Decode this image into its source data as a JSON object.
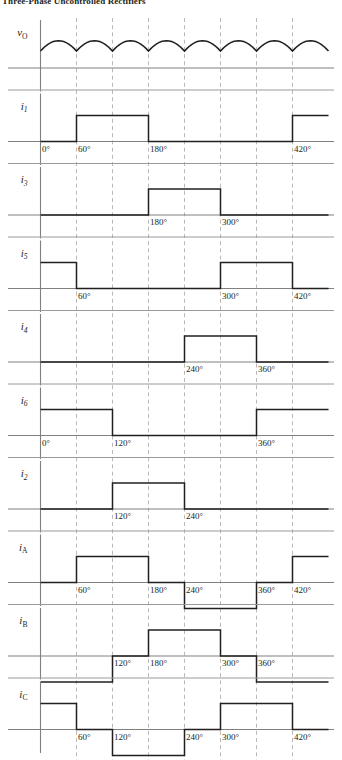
{
  "caption": {
    "text": "Three-Phase Uncontrolled Rectifiers"
  },
  "figure": {
    "x_axis": {
      "unit": "deg",
      "origin_deg": 0,
      "end_deg": 480,
      "grid_step_deg": 60,
      "gridlines_deg": [
        60,
        120,
        180,
        240,
        300,
        360,
        420
      ]
    },
    "panels": [
      {
        "name": "vo",
        "label": "v",
        "subscript": "O",
        "type": "rectified-sine",
        "description": "six-pulse rectified output voltage",
        "humps": 8,
        "hump_width_deg": 60,
        "deg_labels": []
      },
      {
        "name": "i1",
        "label": "i",
        "subscript": "1",
        "type": "pulse",
        "levels": [
          {
            "from_deg": 0,
            "to_deg": 60,
            "value": 0
          },
          {
            "from_deg": 60,
            "to_deg": 180,
            "value": 1
          },
          {
            "from_deg": 180,
            "to_deg": 420,
            "value": 0
          },
          {
            "from_deg": 420,
            "to_deg": 480,
            "value": 1
          }
        ],
        "deg_labels": [
          {
            "deg": 0,
            "text": "0°"
          },
          {
            "deg": 60,
            "text": "60°"
          },
          {
            "deg": 180,
            "text": "180°"
          },
          {
            "deg": 420,
            "text": "420°"
          }
        ]
      },
      {
        "name": "i3",
        "label": "i",
        "subscript": "3",
        "type": "pulse",
        "levels": [
          {
            "from_deg": 0,
            "to_deg": 180,
            "value": 0
          },
          {
            "from_deg": 180,
            "to_deg": 300,
            "value": 1
          },
          {
            "from_deg": 300,
            "to_deg": 480,
            "value": 0
          }
        ],
        "deg_labels": [
          {
            "deg": 180,
            "text": "180°"
          },
          {
            "deg": 300,
            "text": "300°"
          }
        ]
      },
      {
        "name": "i5",
        "label": "i",
        "subscript": "5",
        "type": "pulse",
        "levels": [
          {
            "from_deg": 0,
            "to_deg": 60,
            "value": 1
          },
          {
            "from_deg": 60,
            "to_deg": 300,
            "value": 0
          },
          {
            "from_deg": 300,
            "to_deg": 420,
            "value": 1
          },
          {
            "from_deg": 420,
            "to_deg": 480,
            "value": 0
          }
        ],
        "deg_labels": [
          {
            "deg": 60,
            "text": "60°"
          },
          {
            "deg": 300,
            "text": "300°"
          },
          {
            "deg": 420,
            "text": "420°"
          }
        ]
      },
      {
        "name": "i4",
        "label": "i",
        "subscript": "4",
        "type": "pulse",
        "levels": [
          {
            "from_deg": 0,
            "to_deg": 240,
            "value": 0
          },
          {
            "from_deg": 240,
            "to_deg": 360,
            "value": 1
          },
          {
            "from_deg": 360,
            "to_deg": 480,
            "value": 0
          }
        ],
        "deg_labels": [
          {
            "deg": 240,
            "text": "240°"
          },
          {
            "deg": 360,
            "text": "360°"
          }
        ]
      },
      {
        "name": "i6",
        "label": "i",
        "subscript": "6",
        "type": "pulse",
        "levels": [
          {
            "from_deg": 0,
            "to_deg": 120,
            "value": 1
          },
          {
            "from_deg": 120,
            "to_deg": 360,
            "value": 0
          },
          {
            "from_deg": 360,
            "to_deg": 480,
            "value": 1
          }
        ],
        "deg_labels": [
          {
            "deg": 0,
            "text": "0°"
          },
          {
            "deg": 120,
            "text": "120°"
          },
          {
            "deg": 360,
            "text": "360°"
          }
        ]
      },
      {
        "name": "i2",
        "label": "i",
        "subscript": "2",
        "type": "pulse",
        "levels": [
          {
            "from_deg": 0,
            "to_deg": 120,
            "value": 0
          },
          {
            "from_deg": 120,
            "to_deg": 240,
            "value": 1
          },
          {
            "from_deg": 240,
            "to_deg": 480,
            "value": 0
          }
        ],
        "deg_labels": [
          {
            "deg": 120,
            "text": "120°"
          },
          {
            "deg": 240,
            "text": "240°"
          }
        ]
      },
      {
        "name": "iA",
        "label": "i",
        "subscript": "A",
        "type": "bipolar",
        "levels": [
          {
            "from_deg": 0,
            "to_deg": 60,
            "value": 0
          },
          {
            "from_deg": 60,
            "to_deg": 180,
            "value": 1
          },
          {
            "from_deg": 180,
            "to_deg": 240,
            "value": 0
          },
          {
            "from_deg": 240,
            "to_deg": 360,
            "value": -1
          },
          {
            "from_deg": 360,
            "to_deg": 420,
            "value": 0
          },
          {
            "from_deg": 420,
            "to_deg": 480,
            "value": 1
          }
        ],
        "deg_labels": [
          {
            "deg": 60,
            "text": "60°"
          },
          {
            "deg": 180,
            "text": "180°"
          },
          {
            "deg": 240,
            "text": "240°"
          },
          {
            "deg": 360,
            "text": "360°"
          },
          {
            "deg": 420,
            "text": "420°"
          }
        ]
      },
      {
        "name": "iB",
        "label": "i",
        "subscript": "B",
        "type": "bipolar",
        "levels": [
          {
            "from_deg": 0,
            "to_deg": 120,
            "value": -1
          },
          {
            "from_deg": 120,
            "to_deg": 180,
            "value": 0
          },
          {
            "from_deg": 180,
            "to_deg": 300,
            "value": 1
          },
          {
            "from_deg": 300,
            "to_deg": 360,
            "value": 0
          },
          {
            "from_deg": 360,
            "to_deg": 480,
            "value": -1
          }
        ],
        "deg_labels": [
          {
            "deg": 120,
            "text": "120°"
          },
          {
            "deg": 180,
            "text": "180°"
          },
          {
            "deg": 300,
            "text": "300°"
          },
          {
            "deg": 360,
            "text": "360°"
          }
        ]
      },
      {
        "name": "iC",
        "label": "i",
        "subscript": "C",
        "type": "bipolar",
        "levels": [
          {
            "from_deg": 0,
            "to_deg": 60,
            "value": 1
          },
          {
            "from_deg": 60,
            "to_deg": 120,
            "value": 0
          },
          {
            "from_deg": 120,
            "to_deg": 240,
            "value": -1
          },
          {
            "from_deg": 240,
            "to_deg": 300,
            "value": 0
          },
          {
            "from_deg": 300,
            "to_deg": 420,
            "value": 1
          },
          {
            "from_deg": 420,
            "to_deg": 480,
            "value": 0
          }
        ],
        "deg_labels": [
          {
            "deg": 60,
            "text": "60°"
          },
          {
            "deg": 120,
            "text": "120°"
          },
          {
            "deg": 240,
            "text": "240°"
          },
          {
            "deg": 300,
            "text": "300°"
          },
          {
            "deg": 420,
            "text": "420°"
          }
        ]
      }
    ],
    "colors": {
      "wave": "#231f20",
      "axis": "#808080",
      "grid": "#b9b9b9",
      "separator": "#9a9a9a",
      "background": "#ffffff"
    }
  },
  "chart_data": {
    "type": "line",
    "xlabel": "ωt (degrees)",
    "ylabel": "",
    "xlim": [
      0,
      480
    ],
    "grid": true,
    "legend": "none",
    "x_ticks": [
      0,
      60,
      120,
      180,
      240,
      300,
      360,
      420
    ],
    "x_tick_labels": [
      "0°",
      "60°",
      "120°",
      "180°",
      "240°",
      "300°",
      "360°",
      "420°"
    ],
    "series": [
      {
        "name": "v_O",
        "type": "rectified-sine",
        "period_deg": 60,
        "values": [
          1,
          1,
          1,
          1,
          1,
          1,
          1,
          1
        ]
      },
      {
        "name": "i_1",
        "type": "step",
        "x": [
          0,
          60,
          180,
          420,
          480
        ],
        "values": [
          0,
          1,
          0,
          1,
          1
        ]
      },
      {
        "name": "i_3",
        "type": "step",
        "x": [
          0,
          180,
          300,
          480
        ],
        "values": [
          0,
          1,
          0,
          0
        ]
      },
      {
        "name": "i_5",
        "type": "step",
        "x": [
          0,
          60,
          300,
          420,
          480
        ],
        "values": [
          1,
          0,
          1,
          0,
          0
        ]
      },
      {
        "name": "i_4",
        "type": "step",
        "x": [
          0,
          240,
          360,
          480
        ],
        "values": [
          0,
          1,
          0,
          0
        ]
      },
      {
        "name": "i_6",
        "type": "step",
        "x": [
          0,
          120,
          360,
          480
        ],
        "values": [
          1,
          0,
          1,
          1
        ]
      },
      {
        "name": "i_2",
        "type": "step",
        "x": [
          0,
          120,
          240,
          480
        ],
        "values": [
          0,
          1,
          0,
          0
        ]
      },
      {
        "name": "i_A",
        "type": "step",
        "x": [
          0,
          60,
          180,
          240,
          360,
          420,
          480
        ],
        "values": [
          0,
          1,
          0,
          -1,
          0,
          1,
          1
        ]
      },
      {
        "name": "i_B",
        "type": "step",
        "x": [
          0,
          120,
          180,
          300,
          360,
          480
        ],
        "values": [
          -1,
          0,
          1,
          0,
          -1,
          -1
        ]
      },
      {
        "name": "i_C",
        "type": "step",
        "x": [
          0,
          60,
          120,
          240,
          300,
          420,
          480
        ],
        "values": [
          1,
          0,
          -1,
          0,
          1,
          0,
          0
        ]
      }
    ]
  }
}
